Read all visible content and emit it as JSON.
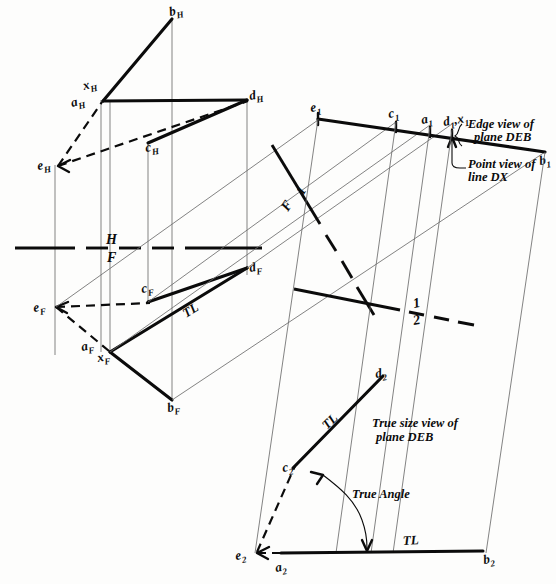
{
  "drawing": {
    "title": "Descriptive geometry construction - edge view and true size view of plane DEB",
    "labels": {
      "bH": "b",
      "bH_sub": "H",
      "xH": "x",
      "xH_sub": "H",
      "aH": "a",
      "aH_sub": "H",
      "dH": "d",
      "dH_sub": "H",
      "cH": "c",
      "cH_sub": "H",
      "eH": "e",
      "eH_sub": "H",
      "eF": "e",
      "eF_sub": "F",
      "cF": "c",
      "cF_sub": "F",
      "dF": "d",
      "dF_sub": "F",
      "aF": "a",
      "aF_sub": "F",
      "xF": "x",
      "xF_sub": "F",
      "bF": "b",
      "bF_sub": "F",
      "e1": "e",
      "e1_sub": "1",
      "c1": "c",
      "c1_sub": "1",
      "a1": "a",
      "a1_sub": "1",
      "d1x1": "d",
      "d1_sub": "1",
      "d1x1_mid": ",x",
      "x1_sub": "1",
      "b1": "b",
      "b1_sub": "1",
      "e2": "e",
      "e2_sub": "2",
      "a2": "a",
      "a2_sub": "2",
      "b2": "b",
      "b2_sub": "2",
      "c2": "c",
      "c2_sub": "2",
      "d2": "d",
      "d2_sub": "2"
    },
    "fold_lines": {
      "hf_top": "H",
      "hf_bottom": "F",
      "f1_top": "F",
      "f1_bottom": "1",
      "onetwo_top": "1",
      "onetwo_bottom": "2"
    },
    "annotations": {
      "edge_view_line1": "Edge view of",
      "edge_view_line2": "plane DEB",
      "point_view_line1": "Point view of",
      "point_view_line2": "line DX",
      "true_size_line1": "True size view of",
      "true_size_line2": "plane DEB",
      "true_angle": "True Angle",
      "tl_front": "TL",
      "tl_true_size_ca": "TL",
      "tl_base": "TL"
    },
    "colors": {
      "ink": "#0b0b0b",
      "projection": "#6d6d6d",
      "paper": "#fdfdfc"
    }
  }
}
